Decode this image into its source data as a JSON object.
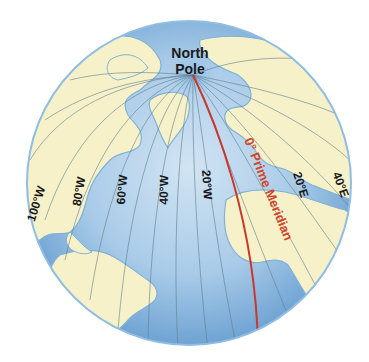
{
  "diagram": {
    "pole_label_line1": "North",
    "pole_label_line2": "Pole",
    "prime_meridian_label": "0° Prime Meridian",
    "meridian_labels": [
      {
        "id": "100w",
        "text": "100°W"
      },
      {
        "id": "80w",
        "text": "80°W"
      },
      {
        "id": "60w",
        "text": "60°W"
      },
      {
        "id": "40w",
        "text": "40°W"
      },
      {
        "id": "20w",
        "text": "20°W"
      },
      {
        "id": "20e",
        "text": "20°E"
      },
      {
        "id": "40e",
        "text": "40°E"
      }
    ],
    "colors": {
      "ocean": "#a9cbe8",
      "ocean_deep": "#7fb0dd",
      "land": "#f7f1c9",
      "coast": "#7fb3d6",
      "meridian": "#5f7d8e",
      "prime_meridian": "#c8392b",
      "text": "#1a1a1a"
    }
  }
}
